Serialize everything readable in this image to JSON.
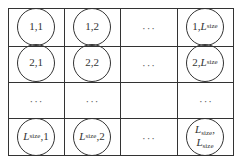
{
  "diagram": {
    "type": "grid-of-nodes",
    "rows": 4,
    "cols": 4,
    "ellipsis": "···",
    "cells": [
      [
        {
          "kind": "node",
          "row": "1",
          "col": "1"
        },
        {
          "kind": "node",
          "row": "1",
          "col": "2"
        },
        {
          "kind": "ellipsis"
        },
        {
          "kind": "node",
          "row": "1",
          "col_var": "L",
          "col_sub": "size"
        }
      ],
      [
        {
          "kind": "node",
          "row": "2",
          "col": "1"
        },
        {
          "kind": "node",
          "row": "2",
          "col": "2"
        },
        {
          "kind": "ellipsis"
        },
        {
          "kind": "node",
          "row": "2",
          "col_var": "L",
          "col_sub": "size"
        }
      ],
      [
        {
          "kind": "ellipsis"
        },
        {
          "kind": "ellipsis"
        },
        {
          "kind": "empty"
        },
        {
          "kind": "ellipsis"
        }
      ],
      [
        {
          "kind": "node",
          "row_var": "L",
          "row_sub": "size",
          "col": "1"
        },
        {
          "kind": "node",
          "row_var": "L",
          "row_sub": "size",
          "col": "2"
        },
        {
          "kind": "ellipsis"
        },
        {
          "kind": "node",
          "row_var": "L",
          "row_sub": "size",
          "col_var": "L",
          "col_sub": "size",
          "stacked": true
        }
      ]
    ],
    "labels": {
      "n11": "1,1",
      "n12": "1,2",
      "n1L_prefix": "1,",
      "n21": "2,1",
      "n22": "2,2",
      "n2L_prefix": "2,",
      "nL1_suffix": ",1",
      "nL2_suffix": ",2",
      "L": "L",
      "size": "size",
      "comma": ","
    }
  }
}
